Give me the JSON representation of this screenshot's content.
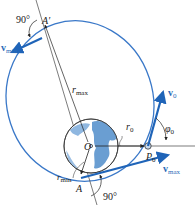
{
  "diagram": {
    "type": "orbital-mechanics",
    "colors": {
      "orbit": "#3a78c8",
      "vector": "#1f64b8",
      "line": "#444444",
      "earth_ocean": "#a9c8e6",
      "earth_land": "#5f93cc",
      "text": "#222222"
    },
    "labels": {
      "angle_top": "90°",
      "angle_bottom": "90°",
      "apogee": "A′",
      "perigee": "A",
      "center": "O",
      "launch_point": "P",
      "launch_point_sub": "0",
      "r_max": "r",
      "r_max_sub": "max",
      "r_min": "r",
      "r_min_sub": "min",
      "r0": "r",
      "r0_sub": "0",
      "phi0": "φ",
      "phi0_sub": "0",
      "v0": "v",
      "v0_sub": "0",
      "v_max": "v",
      "v_max_sub": "max",
      "v_min": "v",
      "v_min_sub": "min"
    }
  }
}
